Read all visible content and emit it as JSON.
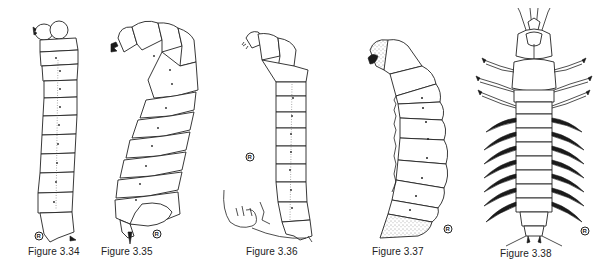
{
  "plate": {
    "background": "#ffffff",
    "ink_color": "#222222",
    "figures": [
      {
        "id": "3.34",
        "caption": "Figure 3.34",
        "subject": "larva lateral view, straight",
        "mark": "R"
      },
      {
        "id": "3.35",
        "caption": "Figure 3.35",
        "subject": "larva lateral view, curved (C-shaped)",
        "mark": "R"
      },
      {
        "id": "3.36",
        "caption": "Figure 3.36",
        "subject": "larva lateral view with enlarged detail of terminal segment",
        "mark": "R"
      },
      {
        "id": "3.37",
        "caption": "Figure 3.37",
        "subject": "larva lateral view with stippled head and terminal segment",
        "mark": "R"
      },
      {
        "id": "3.38",
        "caption": "Figure 3.38",
        "subject": "larva dorsal view with legs and lateral filaments",
        "mark": "R"
      }
    ]
  }
}
